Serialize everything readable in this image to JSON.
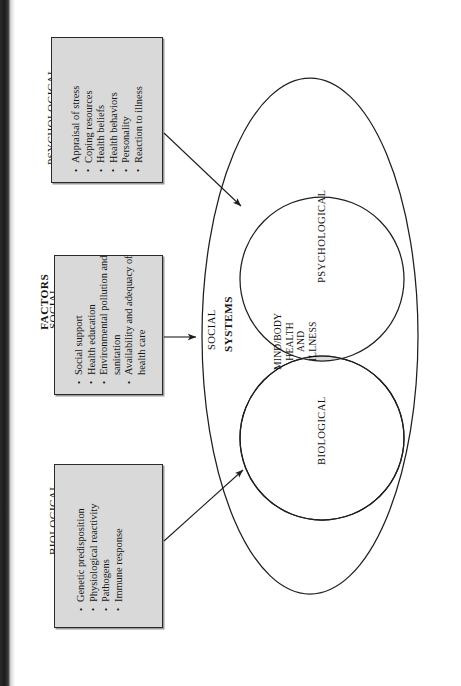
{
  "diagram": {
    "orientation": "rotated-90-ccw",
    "factors_heading": "FACTORS",
    "systems_heading": "SYSTEMS",
    "boxes": [
      {
        "id": "psychological",
        "title": "PSYCHOLOGICAL",
        "items": [
          "Appraisal of stress",
          "Coping resources",
          "Health beliefs",
          "Health behaviors",
          "Personality",
          "Reaction to illness"
        ]
      },
      {
        "id": "social",
        "title": "SOCIAL",
        "items": [
          "Social support",
          "Health education",
          "Environmental pollution and",
          "sanitation",
          "Availability and adequacy of",
          "health care"
        ]
      },
      {
        "id": "biological",
        "title": "BIOLOGICAL",
        "items": [
          "Genetic predisposition",
          "Physiological reactivity",
          "Pathogens",
          "Immune response"
        ]
      }
    ],
    "systems": {
      "outer_label": "SOCIAL",
      "upper_circle_label": "PSYCHOLOGICAL",
      "lower_circle_label": "BIOLOGICAL",
      "intersection_label_lines": [
        "MIND/BODY",
        "HEALTH",
        "AND",
        "ILLNESS"
      ]
    },
    "colors": {
      "box_fill": "#d9d9d9",
      "lens_fill": "#dcdcdc",
      "stroke": "#1e1e1e",
      "page_background": "#ffffff",
      "scan_band": "#222222"
    }
  }
}
